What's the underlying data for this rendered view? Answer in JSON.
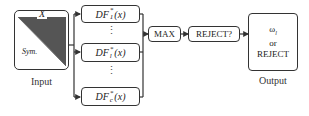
{
  "input": {
    "matrix_top_label": "X",
    "matrix_lower_label": "Sym.",
    "caption": "Input"
  },
  "classifiers": [
    {
      "prefix": "DF",
      "sup": "*",
      "sub": "1",
      "arg": "(x)"
    },
    {
      "prefix": "DF",
      "sup": "*",
      "sub": "l",
      "arg": "(x)"
    },
    {
      "prefix": "DF",
      "sup": "*",
      "sub": "c",
      "arg": "(x)"
    }
  ],
  "ellipsis": "⋮",
  "max_block": {
    "label": "MAX"
  },
  "reject_block": {
    "label": "REJECT?"
  },
  "output": {
    "line1": "ω",
    "line1_sub": "l",
    "line2": "or",
    "line3": "REJECT",
    "caption": "Output"
  },
  "colors": {
    "stroke": "#333333",
    "fill_dark": "#444444"
  }
}
